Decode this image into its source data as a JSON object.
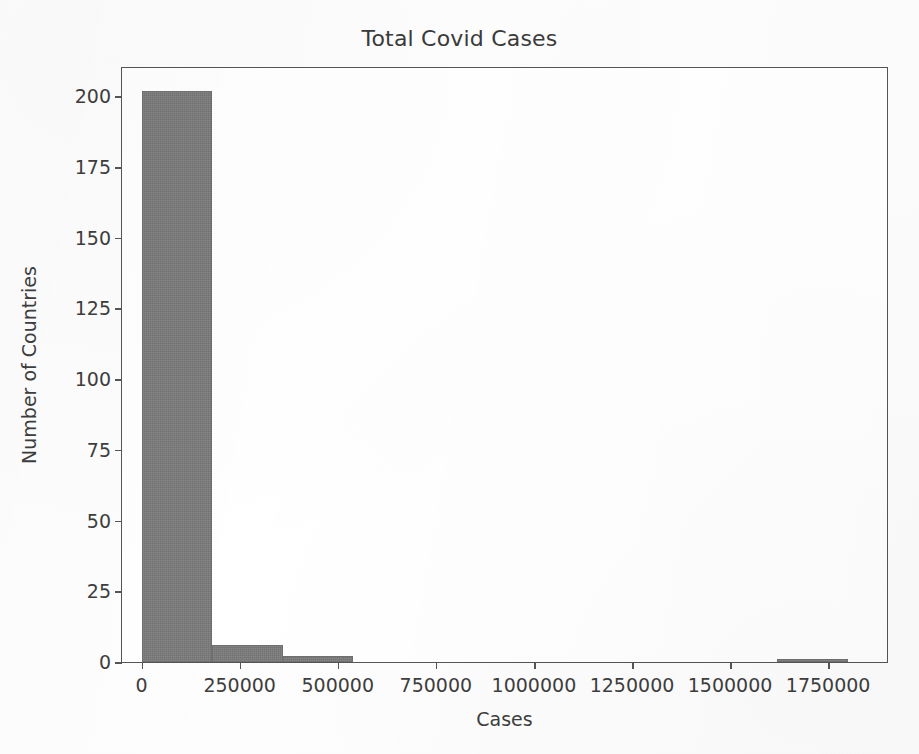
{
  "chart_data": {
    "type": "bar",
    "title": "Total Covid Cases",
    "xlabel": "Cases",
    "ylabel": "Number of Countries",
    "grid": false,
    "legend": false,
    "legend_position": "none",
    "bar_color": "#7b7b7b",
    "edge_color": "#6f6f6f",
    "background_color": "#ffffff",
    "xlim": [
      -50000,
      1900000
    ],
    "ylim": [
      0,
      210
    ],
    "xticks": [
      0,
      250000,
      500000,
      750000,
      1000000,
      1250000,
      1500000,
      1750000
    ],
    "xtick_labels": [
      "0",
      "250000",
      "500000",
      "750000",
      "1000000",
      "1250000",
      "1500000",
      "1750000"
    ],
    "yticks": [
      0,
      25,
      50,
      75,
      100,
      125,
      150,
      175,
      200
    ],
    "ytick_labels": [
      "0",
      "25",
      "50",
      "75",
      "100",
      "125",
      "150",
      "175",
      "200"
    ],
    "bin_edges": [
      0,
      180000,
      360000,
      540000,
      720000,
      900000,
      1080000,
      1260000,
      1440000,
      1620000,
      1800000
    ],
    "bin_centers": [
      90000,
      270000,
      450000,
      630000,
      810000,
      990000,
      1170000,
      1350000,
      1530000,
      1710000
    ],
    "values": [
      202,
      6,
      2,
      0,
      0,
      0,
      0,
      0,
      0,
      1
    ],
    "categories": [
      "0-180000",
      "180000-360000",
      "360000-540000",
      "540000-720000",
      "720000-900000",
      "900000-1080000",
      "1080000-1260000",
      "1260000-1440000",
      "1440000-1620000",
      "1620000-1800000"
    ]
  }
}
